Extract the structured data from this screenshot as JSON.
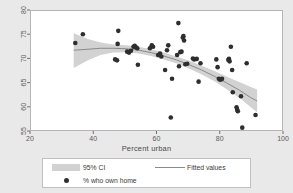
{
  "chart_data": {
    "type": "scatter",
    "title": "",
    "subtitle": "",
    "xlabel": "Percent urban",
    "ylabel": "",
    "xlim": [
      20,
      100
    ],
    "ylim": [
      55,
      80
    ],
    "xticks": [
      20,
      40,
      60,
      80,
      100
    ],
    "yticks": [
      55,
      60,
      65,
      70,
      75,
      80
    ],
    "grid": false,
    "legend_position": "below-plot",
    "legend": [
      {
        "label": "95% CI",
        "key": "band",
        "color": "#d2d2d2"
      },
      {
        "label": "Fitted values",
        "key": "line",
        "color": "#8a8a8a"
      },
      {
        "label": "% who own home",
        "key": "marker",
        "color": "#303030"
      }
    ],
    "series": [
      {
        "name": "% who own home",
        "type": "scatter",
        "marker_color": "#2e2e2e",
        "marker_size": 4.6,
        "points": [
          [
            34.0,
            73.4
          ],
          [
            36.4,
            75.2
          ],
          [
            46.6,
            70.0
          ],
          [
            47.2,
            69.8
          ],
          [
            47.4,
            73.2
          ],
          [
            47.6,
            75.9
          ],
          [
            50.4,
            71.6
          ],
          [
            51.0,
            71.4
          ],
          [
            51.6,
            71.8
          ],
          [
            52.4,
            72.6
          ],
          [
            52.8,
            72.8
          ],
          [
            53.2,
            72.5
          ],
          [
            53.6,
            72.3
          ],
          [
            53.8,
            68.9
          ],
          [
            57.6,
            72.3
          ],
          [
            58.2,
            72.9
          ],
          [
            58.6,
            72.6
          ],
          [
            60.2,
            70.9
          ],
          [
            60.8,
            71.2
          ],
          [
            61.2,
            70.6
          ],
          [
            62.4,
            67.8
          ],
          [
            63.0,
            71.9
          ],
          [
            63.4,
            72.9
          ],
          [
            64.2,
            58.0
          ],
          [
            64.6,
            66.0
          ],
          [
            66.2,
            70.9
          ],
          [
            66.6,
            77.5
          ],
          [
            66.8,
            68.6
          ],
          [
            67.2,
            71.5
          ],
          [
            67.6,
            71.6
          ],
          [
            68.0,
            74.5
          ],
          [
            68.2,
            74.8
          ],
          [
            68.4,
            73.9
          ],
          [
            68.8,
            69.0
          ],
          [
            69.4,
            69.1
          ],
          [
            71.2,
            70.2
          ],
          [
            71.6,
            70.0
          ],
          [
            72.4,
            70.1
          ],
          [
            73.0,
            65.4
          ],
          [
            73.6,
            69.2
          ],
          [
            78.6,
            70.0
          ],
          [
            79.0,
            68.4
          ],
          [
            79.4,
            66.0
          ],
          [
            79.8,
            65.8
          ],
          [
            80.2,
            65.9
          ],
          [
            80.4,
            66.0
          ],
          [
            82.4,
            69.9
          ],
          [
            82.6,
            70.1
          ],
          [
            82.8,
            69.6
          ],
          [
            83.2,
            72.6
          ],
          [
            83.6,
            67.8
          ],
          [
            83.8,
            63.2
          ],
          [
            85.0,
            60.1
          ],
          [
            85.2,
            59.6
          ],
          [
            85.4,
            59.3
          ],
          [
            86.4,
            62.4
          ],
          [
            86.8,
            55.9
          ],
          [
            88.2,
            69.2
          ],
          [
            91.0,
            58.5
          ]
        ]
      },
      {
        "name": "Fitted values",
        "type": "line",
        "color": "#8a8a8a",
        "points": [
          [
            33.5,
            71.9
          ],
          [
            38.0,
            72.1
          ],
          [
            42.0,
            72.3
          ],
          [
            46.0,
            72.3
          ],
          [
            50.0,
            72.2
          ],
          [
            54.0,
            71.9
          ],
          [
            58.0,
            71.4
          ],
          [
            62.0,
            70.7
          ],
          [
            66.0,
            69.9
          ],
          [
            70.0,
            68.9
          ],
          [
            74.0,
            67.8
          ],
          [
            78.0,
            66.5
          ],
          [
            82.0,
            65.1
          ],
          [
            86.0,
            63.6
          ],
          [
            89.5,
            62.1
          ],
          [
            91.5,
            61.4
          ]
        ]
      },
      {
        "name": "95% CI",
        "type": "band",
        "color": "#d2d2d2",
        "upper": [
          [
            33.5,
            75.4
          ],
          [
            38.0,
            74.2
          ],
          [
            42.0,
            73.5
          ],
          [
            46.0,
            73.1
          ],
          [
            50.0,
            72.9
          ],
          [
            54.0,
            72.6
          ],
          [
            58.0,
            72.1
          ],
          [
            62.0,
            71.4
          ],
          [
            66.0,
            70.6
          ],
          [
            70.0,
            69.7
          ],
          [
            74.0,
            68.7
          ],
          [
            78.0,
            67.6
          ],
          [
            82.0,
            66.4
          ],
          [
            86.0,
            65.3
          ],
          [
            89.5,
            64.3
          ],
          [
            91.5,
            63.8
          ]
        ],
        "lower": [
          [
            33.5,
            68.2
          ],
          [
            38.0,
            69.8
          ],
          [
            42.0,
            70.9
          ],
          [
            46.0,
            71.4
          ],
          [
            50.0,
            71.5
          ],
          [
            54.0,
            71.2
          ],
          [
            58.0,
            70.7
          ],
          [
            62.0,
            70.0
          ],
          [
            66.0,
            69.2
          ],
          [
            70.0,
            68.1
          ],
          [
            74.0,
            66.9
          ],
          [
            78.0,
            65.5
          ],
          [
            82.0,
            63.8
          ],
          [
            86.0,
            62.0
          ],
          [
            89.5,
            60.1
          ],
          [
            91.5,
            59.1
          ]
        ]
      }
    ]
  }
}
